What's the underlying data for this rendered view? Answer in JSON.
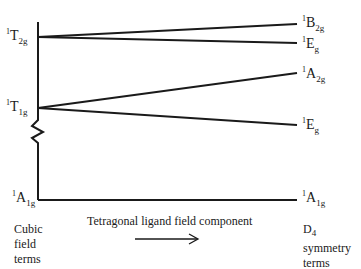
{
  "diagram": {
    "type": "energy-level correlation diagram",
    "left_levels": [
      {
        "id": "T2g",
        "sup": "1",
        "main": "T",
        "sub": "2g",
        "y": 37
      },
      {
        "id": "T1g",
        "sup": "1",
        "main": "T",
        "sub": "1g",
        "y": 108
      },
      {
        "id": "A1g",
        "sup": "1",
        "main": "A",
        "sub": "1g",
        "y": 200
      }
    ],
    "right_levels": [
      {
        "id": "B2g",
        "sup": "1",
        "main": "B",
        "sub": "2g",
        "y": 24,
        "from": "T2g"
      },
      {
        "id": "Eg_upper",
        "sup": "1",
        "main": "E",
        "sub": "g",
        "y": 43,
        "from": "T2g"
      },
      {
        "id": "A2g",
        "sup": "1",
        "main": "A",
        "sub": "2g",
        "y": 73,
        "from": "T1g"
      },
      {
        "id": "Eg_lower",
        "sup": "1",
        "main": "E",
        "sub": "g",
        "y": 125,
        "from": "T1g"
      },
      {
        "id": "A1g_right",
        "sup": "1",
        "main": "A",
        "sub": "1g",
        "y": 200,
        "from": "A1g"
      }
    ],
    "left_caption": [
      "Cubic",
      "field",
      "terms"
    ],
    "right_caption": [
      "D",
      "symmetry",
      "terms"
    ],
    "right_caption_sub": "4",
    "axis_label": "Tetragonal ligand field component",
    "axis_arrow": "right-arrow",
    "axis_break": "zigzag",
    "line_color": "#1a1a1a"
  }
}
